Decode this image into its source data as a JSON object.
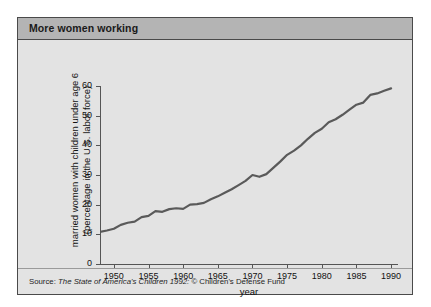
{
  "panel": {
    "title": "More women working",
    "bg_color": "#e3e3e3",
    "title_bar_color": "#b4b4b4",
    "border_color": "#4a4a4a"
  },
  "source": {
    "prefix": "Source:",
    "italic_part": "The State of America's Children 1992:",
    "suffix": "© Children's Defense Fund"
  },
  "chart_data": {
    "type": "line",
    "title": "More women working",
    "xlabel": "year",
    "ylabel": "married women with children under age 6 (percentage in the U.S. labor force)",
    "xlim": [
      1948,
      1991
    ],
    "ylim": [
      0,
      60
    ],
    "grid": false,
    "legend": "none",
    "line_color": "#5a5a5a",
    "line_width": 2.2,
    "xticks": [
      1950,
      1955,
      1960,
      1965,
      1970,
      1975,
      1980,
      1985,
      1990
    ],
    "xtick_labels": [
      "1950",
      "1955",
      "1960",
      "1965",
      "1970",
      "1975",
      "1980",
      "1985",
      "1990"
    ],
    "yticks": [
      0,
      10,
      20,
      30,
      40,
      50,
      60
    ],
    "ytick_labels": [
      "0",
      "10",
      "20",
      "30",
      "40",
      "50",
      "60"
    ],
    "x": [
      1948,
      1949,
      1950,
      1951,
      1952,
      1953,
      1954,
      1955,
      1956,
      1957,
      1958,
      1959,
      1960,
      1961,
      1962,
      1963,
      1964,
      1965,
      1966,
      1967,
      1968,
      1969,
      1970,
      1971,
      1972,
      1973,
      1974,
      1975,
      1976,
      1977,
      1978,
      1979,
      1980,
      1981,
      1982,
      1983,
      1984,
      1985,
      1986,
      1987,
      1988,
      1989,
      1990
    ],
    "values": [
      10.8,
      11.3,
      11.9,
      13.2,
      13.9,
      14.3,
      15.8,
      16.2,
      17.8,
      17.6,
      18.5,
      18.8,
      18.6,
      20.0,
      20.2,
      20.6,
      21.8,
      22.8,
      24.0,
      25.2,
      26.6,
      28.0,
      30.0,
      29.4,
      30.3,
      32.4,
      34.5,
      36.8,
      38.2,
      40.0,
      42.2,
      44.2,
      45.6,
      47.8,
      48.8,
      50.3,
      52.0,
      53.7,
      54.4,
      57.0,
      57.5,
      58.4,
      59.2
    ],
    "annotations": []
  }
}
